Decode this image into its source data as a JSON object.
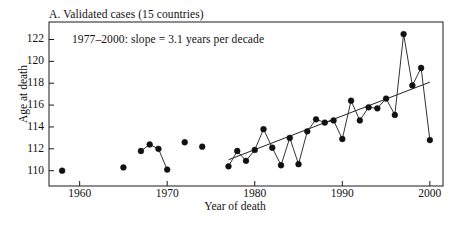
{
  "figure": {
    "panel_title": "A. Validated cases (15 countries)",
    "annotation": "1977–2000: slope = 3.1 years per decade",
    "xlabel": "Year of death",
    "ylabel": "Age at death"
  },
  "style": {
    "axis_color": "#1a1a1a",
    "marker_color": "#111111",
    "line_color": "#333333",
    "trend_color": "#222222",
    "background": "#ffffff"
  },
  "chart_data": {
    "type": "line",
    "title": "A. Validated cases (15 countries)",
    "xlabel": "Year of death",
    "ylabel": "Age at death",
    "xlim": [
      1956.5,
      2001.5
    ],
    "ylim": [
      108.6,
      123.6
    ],
    "xticks": [
      1960,
      1970,
      1980,
      1990,
      2000
    ],
    "yticks": [
      110,
      112,
      114,
      116,
      118,
      120,
      122
    ],
    "grid": false,
    "legend": null,
    "annotations": [
      {
        "text": "1977–2000: slope = 3.1 years per decade",
        "x": 1961.5,
        "y": 121.4
      }
    ],
    "marker": "filled-circle",
    "series": [
      {
        "name": "Maximum reported age at death",
        "connected_segments": [
          [
            1958
          ],
          [
            1965
          ],
          [
            1967,
            1968,
            1969,
            1970
          ],
          [
            1972
          ],
          [
            1974
          ],
          [
            1977,
            1978,
            1979,
            1980,
            1981,
            1982,
            1983,
            1984,
            1985,
            1986,
            1987,
            1988,
            1989,
            1990,
            1991,
            1992,
            1993,
            1994,
            1995,
            1996,
            1997,
            1998,
            1999,
            2000
          ]
        ],
        "x": [
          1958,
          1965,
          1967,
          1968,
          1969,
          1970,
          1972,
          1974,
          1977,
          1978,
          1979,
          1980,
          1981,
          1982,
          1983,
          1984,
          1985,
          1986,
          1987,
          1988,
          1989,
          1990,
          1991,
          1992,
          1993,
          1994,
          1995,
          1996,
          1997,
          1998,
          1999,
          2000
        ],
        "y": [
          110.0,
          110.3,
          111.8,
          112.4,
          112.0,
          110.1,
          112.6,
          112.2,
          110.4,
          111.8,
          110.9,
          111.9,
          113.8,
          112.1,
          110.5,
          113.0,
          110.6,
          113.6,
          114.7,
          114.4,
          114.6,
          112.9,
          116.4,
          114.6,
          115.8,
          115.7,
          116.6,
          115.1,
          122.5,
          117.8,
          119.4,
          112.8
        ]
      }
    ],
    "trend_line": {
      "name": "1977–2000 regression",
      "slope_per_decade": 3.1,
      "x_start": 1977,
      "y_start": 111.0,
      "x_end": 2000,
      "y_end": 118.1
    }
  },
  "axes": {
    "ytick_labels": [
      "122",
      "120",
      "118",
      "116",
      "114",
      "112",
      "110"
    ],
    "xtick_labels": [
      "1960",
      "1970",
      "1980",
      "1990",
      "2000"
    ]
  }
}
